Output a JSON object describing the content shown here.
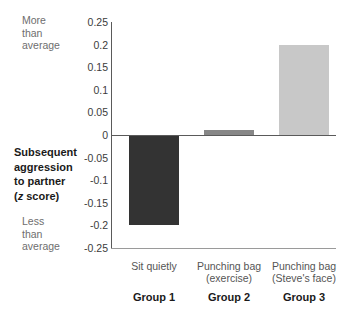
{
  "chart_data": {
    "type": "bar",
    "title": "",
    "subtitle": "",
    "xlabel": "",
    "ylabel": "Subsequent aggression to partner (z score)",
    "ylim": [
      -0.25,
      0.25
    ],
    "grid": false,
    "legend": "none",
    "categories": [
      "Sit quietly",
      "Punching bag (exercise)",
      "Punching bag (Steve's face)"
    ],
    "group_labels": [
      "Group 1",
      "Group 2",
      "Group 3"
    ],
    "values": [
      -0.2,
      0.01,
      0.2
    ],
    "series": [
      {
        "name": "Subsequent aggression to partner (z score)",
        "values": [
          -0.2,
          0.01,
          0.2
        ]
      }
    ],
    "bar_colors": [
      "#333333",
      "#878787",
      "#c8c8c8"
    ],
    "yticks": [
      0.25,
      0.2,
      0.15,
      0.1,
      0.05,
      0,
      -0.05,
      -0.1,
      -0.15,
      -0.2,
      -0.25
    ],
    "ytick_labels": [
      "0.25",
      "0.2",
      "0.15",
      "0.1",
      "0.05",
      "0",
      "-0.05",
      "-0.1",
      "-0.15",
      "-0.2",
      "-0.25"
    ],
    "annotations": {
      "top": "More\nthan\naverage",
      "bottom": "Less\nthan\naverage"
    }
  },
  "axis_title": {
    "line1": "Subsequent",
    "line2": "aggression",
    "line3": "to partner",
    "line4_prefix": "(",
    "line4_italic": "z",
    "line4_suffix": " score)"
  },
  "xaxis": {
    "cat1": "Sit quietly",
    "cat2": "Punching bag\n(exercise)",
    "cat3": "Punching bag\n(Steve's face)",
    "grp1": "Group 1",
    "grp2": "Group 2",
    "grp3": "Group 3"
  },
  "notes": {
    "more": "More\nthan\naverage",
    "less": "Less\nthan\naverage"
  },
  "colors": {
    "bar1": "#333333",
    "bar2": "#878787",
    "bar3": "#c8c8c8",
    "axis": "#5a5a5a",
    "text": "#3b3b3b",
    "muted": "#6e6e6e"
  }
}
